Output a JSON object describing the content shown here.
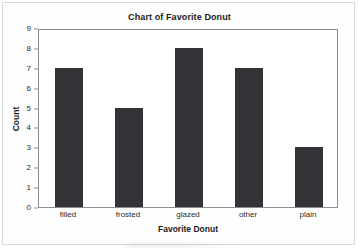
{
  "chart_data": {
    "type": "bar",
    "title": "Chart of Favorite Donut",
    "xlabel": "Favorite Donut",
    "ylabel": "Count",
    "categories": [
      "filled",
      "frosted",
      "glazed",
      "other",
      "plain"
    ],
    "values": [
      7,
      5,
      8,
      7,
      3
    ],
    "ylim": [
      0,
      9
    ],
    "yticks": [
      0,
      1,
      2,
      3,
      4,
      5,
      6,
      7,
      8,
      9
    ],
    "ytick_labels": [
      "0",
      "1",
      "2",
      "3",
      "4",
      "5",
      "6",
      "7",
      "8",
      "9"
    ],
    "grid": false,
    "legend": false,
    "bar_color": "#333338",
    "plot_border_color": "#8c8c99",
    "background_color": "#ffffff",
    "text_color": "#1a1a1a"
  }
}
